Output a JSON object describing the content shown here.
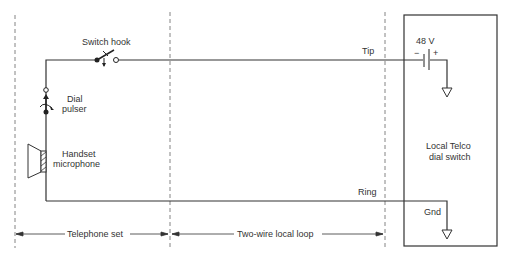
{
  "diagram": {
    "type": "circuit",
    "labels": {
      "switch_hook": "Switch hook",
      "dial_pulser_line1": "Dial",
      "dial_pulser_line2": "pulser",
      "handset_line1": "Handset",
      "handset_line2": "microphone",
      "tip": "Tip",
      "ring": "Ring",
      "battery_voltage": "48 V",
      "battery_minus": "−",
      "battery_plus": "+",
      "telco_line1": "Local Telco",
      "telco_line2": "dial switch",
      "gnd": "Gnd"
    },
    "regions": [
      {
        "label": "Telephone set"
      },
      {
        "label": "Two-wire local loop"
      }
    ],
    "colors": {
      "line": "#333333",
      "dashed": "#555555",
      "background": "#ffffff"
    }
  }
}
